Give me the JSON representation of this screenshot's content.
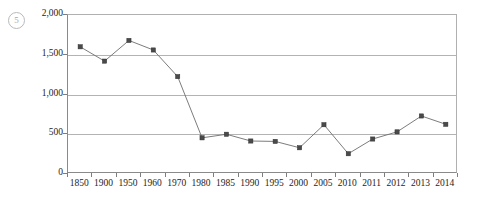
{
  "figure": {
    "index_badge": "5"
  },
  "chart_data": {
    "type": "line",
    "title": "",
    "xlabel": "",
    "ylabel": "",
    "categories": [
      "1850",
      "1900",
      "1950",
      "1960",
      "1970",
      "1980",
      "1985",
      "1990",
      "1995",
      "2000",
      "2005",
      "2010",
      "2011",
      "2012",
      "2013",
      "2014"
    ],
    "values": [
      1600,
      1420,
      1680,
      1560,
      1225,
      455,
      500,
      415,
      410,
      330,
      620,
      255,
      440,
      530,
      730,
      625
    ],
    "ylim": [
      0,
      2000
    ],
    "ytick_values": [
      0,
      500,
      1000,
      1500,
      2000
    ],
    "ytick_labels": [
      "0",
      "500",
      "1,000",
      "1,500",
      "2,000"
    ],
    "grid": true,
    "grid_axis": "y",
    "legend": false,
    "marker": "square",
    "line_color": "#6d6d6d",
    "marker_color": "#4a4a4a",
    "grid_color": "#b3b3b3",
    "axis_color": "#8a8a8a"
  }
}
